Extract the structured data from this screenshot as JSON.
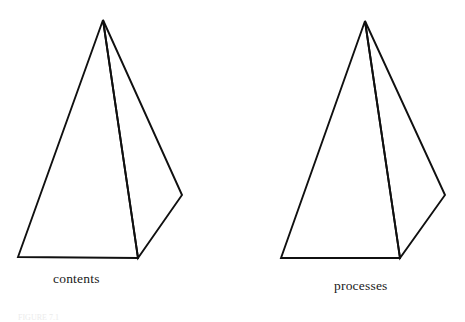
{
  "figure": {
    "background_color": "#ffffff",
    "stroke_color": "#101010",
    "text_color": "#1a1a1a",
    "caption_text": "FIGURE 7.1",
    "shapes": [
      {
        "name": "contents-pyramid",
        "label": "contents",
        "front_face_points": "103,20 18,257 138,258",
        "side_face_points": "103,20 138,258 182,195",
        "apex": [
          103,
          20
        ],
        "bottom_left": [
          18,
          257
        ],
        "bottom_front_right": [
          138,
          258
        ],
        "right_vertex": [
          182,
          195
        ]
      },
      {
        "name": "processes-pyramid",
        "label": "processes",
        "front_face_points": "365,21 281,258 400,258",
        "side_face_points": "365,21 400,258 445,195",
        "apex": [
          365,
          21
        ],
        "bottom_left": [
          281,
          258
        ],
        "bottom_front_right": [
          400,
          258
        ],
        "right_vertex": [
          445,
          195
        ]
      }
    ]
  },
  "labels": {
    "contents": "contents",
    "processes": "processes"
  }
}
